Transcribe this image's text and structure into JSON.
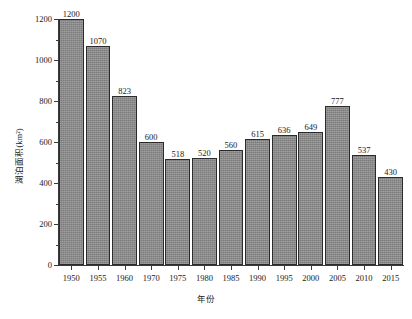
{
  "chart_data": {
    "type": "bar",
    "title": "",
    "xlabel": "年份",
    "ylabel": "湖泊面积(km²)",
    "categories": [
      "1950",
      "1955",
      "1960",
      "1970",
      "1975",
      "1980",
      "1985",
      "1990",
      "1995",
      "2000",
      "2005",
      "2010",
      "2015"
    ],
    "values": [
      1200,
      1070,
      823,
      600,
      518,
      520,
      560,
      615,
      636,
      649,
      777,
      537,
      430
    ],
    "value_labels": [
      "1200",
      "1070",
      "823",
      "600",
      "518",
      "520",
      "560",
      "615",
      "636",
      "649",
      "777",
      "537",
      "430"
    ],
    "ylim": [
      0,
      1200
    ],
    "xlim_note": "categorical",
    "y_major_ticks": [
      0,
      200,
      400,
      600,
      800,
      1000,
      1200
    ],
    "y_major_tick_labels": [
      "0",
      "200",
      "400",
      "600",
      "800",
      "1000",
      "1200"
    ],
    "y_minor_ticks": [
      100,
      300,
      500,
      700,
      900,
      1100
    ],
    "grid": false,
    "legend": null,
    "bar_color": "#8b8b8b",
    "bar_edge_color": "#2b2b2b",
    "background_color": "#ffffff",
    "axis_color": "#3a3a3a",
    "text_color": "#1a1a1a",
    "spines": [
      "left",
      "bottom"
    ]
  }
}
